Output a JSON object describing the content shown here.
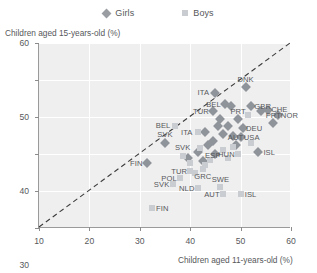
{
  "legend": {
    "items": [
      {
        "label": "Girls",
        "marker": "diamond-marker",
        "color": "#8f949a"
      },
      {
        "label": "Boys",
        "marker": "square-marker",
        "color": "#c9ccd0"
      }
    ]
  },
  "chart_data": {
    "type": "scatter",
    "title": "",
    "xlabel": "Children aged 11-years-old (%)",
    "ylabel": "Children aged 15-years-old (%)",
    "xlim": [
      10,
      60
    ],
    "ylim": [
      10,
      60
    ],
    "xticks": [
      10,
      20,
      30,
      40,
      50,
      60
    ],
    "yticks": [
      10,
      20,
      30,
      40,
      50,
      60
    ],
    "grid": true,
    "legend_position": "top-center",
    "reference_line": {
      "type": "diagonal",
      "from": [
        10,
        10
      ],
      "to": [
        60,
        60
      ],
      "style": "dashed"
    },
    "series": [
      {
        "name": "Girls",
        "marker": "diamond",
        "color": "#8f949a",
        "points": [
          {
            "label": "ITA",
            "x": 45.0,
            "y": 46.5,
            "label_dx": -12,
            "label_dy": -1
          },
          {
            "label": "DNK",
            "x": 51.0,
            "y": 48.0,
            "label_dx": 0,
            "label_dy": -8
          },
          {
            "label": "BEL",
            "x": 47.0,
            "y": 43.5,
            "label_dx": -12,
            "label_dy": 0
          },
          {
            "label": "GBR",
            "x": 52.0,
            "y": 43.0,
            "label_dx": 12,
            "label_dy": 0
          },
          {
            "label": "CHE",
            "x": 55.5,
            "y": 42.0,
            "label_dx": 11,
            "label_dy": -1
          },
          {
            "label": "NOR",
            "x": 57.5,
            "y": 40.5,
            "label_dx": 11,
            "label_dy": 0
          },
          {
            "label": "PRT",
            "x": 49.5,
            "y": 39.5,
            "label_dx": 0,
            "label_dy": -8
          },
          {
            "label": "PRT2",
            "x": 56.5,
            "y": 38.5,
            "label_dx": 0,
            "label_dy": -8
          },
          {
            "label": "DEU",
            "x": 50.5,
            "y": 37.0,
            "label_dx": 11,
            "label_dy": 0
          },
          {
            "label": "USA",
            "x": 50.0,
            "y": 34.5,
            "label_dx": 11,
            "label_dy": 0
          },
          {
            "label": "AUT",
            "x": 49.0,
            "y": 32.5,
            "label_dx": 0,
            "label_dy": -8
          },
          {
            "label": "ISL",
            "x": 53.5,
            "y": 30.5,
            "label_dx": 11,
            "label_dy": 0
          },
          {
            "label": "HUN",
            "x": 45.0,
            "y": 30.0,
            "label_dx": 11,
            "label_dy": 0
          },
          {
            "label": "ESP",
            "x": 42.5,
            "y": 28.0,
            "label_dx": 10,
            "label_dy": -6
          },
          {
            "label": "SVK",
            "x": 35.0,
            "y": 33.0,
            "label_dx": 0,
            "label_dy": -9
          },
          {
            "label": "FIN",
            "x": 31.5,
            "y": 27.5,
            "label_dx": -11,
            "label_dy": 0
          },
          {
            "label": "TUR",
            "x": 44.5,
            "y": 41.5,
            "label_dx": -12,
            "label_dy": 0
          },
          {
            "label": "C1",
            "x": 46.0,
            "y": 39.5,
            "label_dx": 0,
            "label_dy": 0
          },
          {
            "label": "C2",
            "x": 45.5,
            "y": 37.5,
            "label_dx": 0,
            "label_dy": 0
          },
          {
            "label": "C3",
            "x": 47.5,
            "y": 37.5,
            "label_dx": 0,
            "label_dy": 0
          },
          {
            "label": "C4",
            "x": 46.5,
            "y": 35.5,
            "label_dx": 0,
            "label_dy": 0
          },
          {
            "label": "C5",
            "x": 48.5,
            "y": 35.0,
            "label_dx": 0,
            "label_dy": 0
          },
          {
            "label": "C6",
            "x": 43.5,
            "y": 32.5,
            "label_dx": 0,
            "label_dy": 0
          },
          {
            "label": "C7",
            "x": 44.5,
            "y": 33.5,
            "label_dx": 0,
            "label_dy": 0
          },
          {
            "label": "C8",
            "x": 41.5,
            "y": 30.5,
            "label_dx": 0,
            "label_dy": 0
          },
          {
            "label": "C9",
            "x": 39.5,
            "y": 29.0,
            "label_dx": 0,
            "label_dy": 0
          },
          {
            "label": "C10",
            "x": 43.0,
            "y": 36.0,
            "label_dx": 0,
            "label_dy": 0
          },
          {
            "label": "C11",
            "x": 54.0,
            "y": 41.5,
            "label_dx": 0,
            "label_dy": 0
          },
          {
            "label": "C12",
            "x": 48.0,
            "y": 43.0,
            "label_dx": 0,
            "label_dy": 0
          }
        ]
      },
      {
        "name": "Boys",
        "marker": "square",
        "color": "#c9ccd0",
        "points": [
          {
            "label": "BEL",
            "x": 37.0,
            "y": 37.5,
            "label_dx": -12,
            "label_dy": -1
          },
          {
            "label": "ITA",
            "x": 41.5,
            "y": 36.0,
            "label_dx": -11,
            "label_dy": 0
          },
          {
            "label": "TUR",
            "x": 40.0,
            "y": 25.5,
            "label_dx": -11,
            "label_dy": 0
          },
          {
            "label": "POL",
            "x": 38.0,
            "y": 23.5,
            "label_dx": -11,
            "label_dy": 0
          },
          {
            "label": "SVK",
            "x": 36.5,
            "y": 22.0,
            "label_dx": -11,
            "label_dy": 0
          },
          {
            "label": "SVK2",
            "x": 38.5,
            "y": 29.5,
            "label_dx": 0,
            "label_dy": -9
          },
          {
            "label": "NLD",
            "x": 41.5,
            "y": 20.8,
            "label_dx": -11,
            "label_dy": 0
          },
          {
            "label": "SWE",
            "x": 46.0,
            "y": 21.0,
            "label_dx": 0,
            "label_dy": -8
          },
          {
            "label": "AUT",
            "x": 46.5,
            "y": 19.3,
            "label_dx": -11,
            "label_dy": 0
          },
          {
            "label": "ISL",
            "x": 50.0,
            "y": 19.3,
            "label_dx": 10,
            "label_dy": 0
          },
          {
            "label": "GRC",
            "x": 42.5,
            "y": 26.0,
            "label_dx": 0,
            "label_dy": 7
          },
          {
            "label": "FIN",
            "x": 32.5,
            "y": 15.5,
            "label_dx": 10,
            "label_dy": 0
          },
          {
            "label": "D1",
            "x": 44.0,
            "y": 28.5,
            "label_dx": 0,
            "label_dy": 0
          },
          {
            "label": "D2",
            "x": 46.5,
            "y": 31.0,
            "label_dx": 0,
            "label_dy": 0
          },
          {
            "label": "D3",
            "x": 48.5,
            "y": 32.0,
            "label_dx": 0,
            "label_dy": 0
          },
          {
            "label": "D4",
            "x": 52.0,
            "y": 33.0,
            "label_dx": 0,
            "label_dy": 0
          },
          {
            "label": "D5",
            "x": 43.0,
            "y": 27.0,
            "label_dx": 0,
            "label_dy": 0
          },
          {
            "label": "D6",
            "x": 41.0,
            "y": 25.0,
            "label_dx": 0,
            "label_dy": 0
          },
          {
            "label": "D7",
            "x": 40.0,
            "y": 27.5,
            "label_dx": 0,
            "label_dy": 0
          },
          {
            "label": "D8",
            "x": 47.5,
            "y": 29.0,
            "label_dx": 0,
            "label_dy": 0
          },
          {
            "label": "D9",
            "x": 49.5,
            "y": 30.0,
            "label_dx": 0,
            "label_dy": 0
          },
          {
            "label": "D10",
            "x": 51.5,
            "y": 40.5,
            "label_dx": 0,
            "label_dy": 0
          },
          {
            "label": "D11",
            "x": 42.0,
            "y": 31.5,
            "label_dx": 0,
            "label_dy": 0
          }
        ]
      }
    ]
  }
}
